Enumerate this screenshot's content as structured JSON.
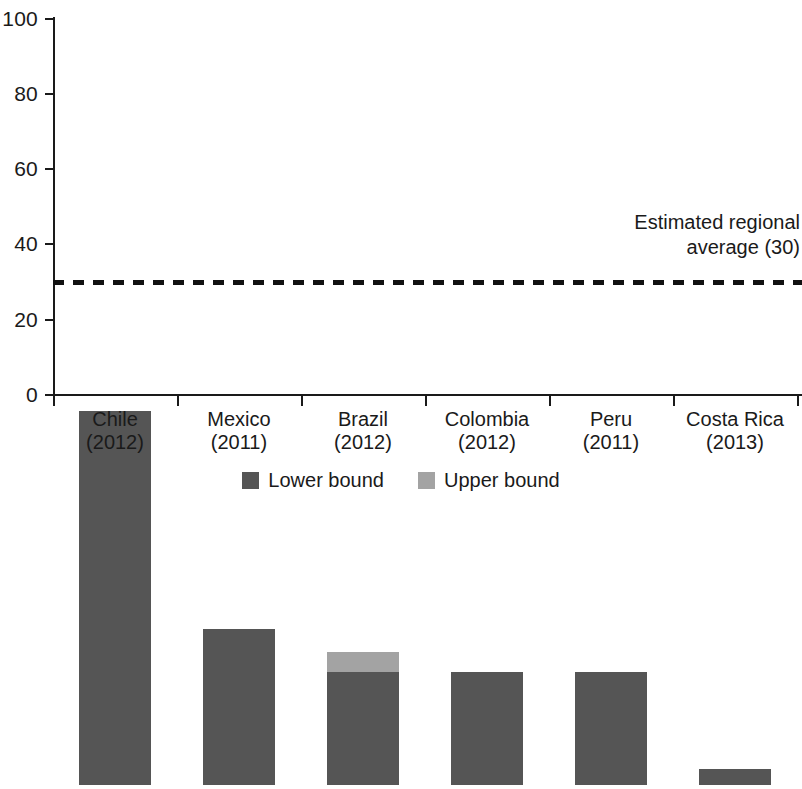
{
  "chart_data": {
    "type": "bar",
    "title": "",
    "subtitle": "",
    "xlabel": "",
    "ylabel": "",
    "ylim": [
      0,
      100
    ],
    "yticks": [
      0,
      20,
      40,
      60,
      80,
      100
    ],
    "grid": false,
    "legend_position": "bottom",
    "categories": [
      "Chile\n(2012)",
      "Mexico\n(2011)",
      "Brazil\n(2012)",
      "Colombia\n(2012)",
      "Peru\n(2011)",
      "Costa Rica\n(2013)"
    ],
    "category_names": [
      "Chile",
      "Mexico",
      "Brazil",
      "Colombia",
      "Peru",
      "Costa Rica"
    ],
    "category_years": [
      "(2012)",
      "(2011)",
      "(2012)",
      "(2012)",
      "(2011)",
      "(2013)"
    ],
    "series": [
      {
        "name": "Lower bound",
        "color": "#555555",
        "values": [
          99.5,
          41.5,
          30,
          30,
          30,
          4.3
        ]
      },
      {
        "name": "Upper bound",
        "color": "#a3a3a3",
        "values": [
          99.5,
          41.5,
          35.5,
          30,
          30,
          4.3
        ]
      }
    ],
    "annotations": [
      {
        "name": "estimated-regional-average",
        "line1": "Estimated regional",
        "line2": "average (30)",
        "value": 30,
        "line_style": "dashed",
        "line_color": "#111111"
      }
    ],
    "legend": [
      {
        "label": "Lower bound",
        "color": "#555555"
      },
      {
        "label": "Upper bound",
        "color": "#a3a3a3"
      }
    ],
    "axis": {
      "tick_labels": [
        "100",
        "80",
        "60",
        "40",
        "20",
        "0"
      ],
      "axis_color": "#1a1a1a"
    }
  }
}
